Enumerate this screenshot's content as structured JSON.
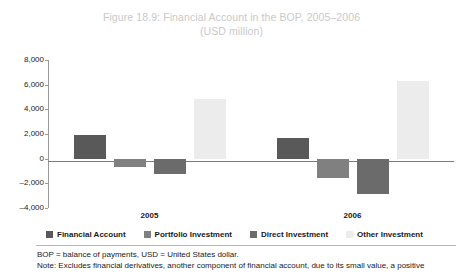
{
  "figure": {
    "title_line1": "Figure 18.9: Financial Account in the BOP, 2005–2006",
    "title_line2": "(USD million)",
    "title_color": "#c9c9c9"
  },
  "chart_data": {
    "type": "bar",
    "title": "Figure 18.9: Financial Account in the BOP, 2005–2006 (USD million)",
    "xlabel": "",
    "ylabel": "",
    "ylim": [
      -4000,
      8000
    ],
    "ytick_step": 2000,
    "grid": false,
    "legend_position": "bottom",
    "categories": [
      "2005",
      "2006"
    ],
    "tick_labels": [
      "8,000",
      "6,000",
      "4,000",
      "2,000",
      "0",
      "–2,000",
      "–4,000"
    ],
    "tick_values": [
      8000,
      6000,
      4000,
      2000,
      0,
      -2000,
      -4000
    ],
    "series": [
      {
        "name": "Financial Account",
        "color": "#595959",
        "values": [
          1900,
          1700
        ]
      },
      {
        "name": "Portfolio Investment",
        "color": "#808080",
        "values": [
          -700,
          -1600
        ]
      },
      {
        "name": "Direct Investment",
        "color": "#6b6b6b",
        "values": [
          -1250,
          -2900
        ]
      },
      {
        "name": "Other Investment",
        "color": "#ececec",
        "values": [
          4800,
          6300
        ]
      }
    ]
  },
  "notes": {
    "line1": "BOP = balance of payments, USD = United States dollar.",
    "line2": "Note: Excludes financial derivatives, another component of financial account, due to its small value, a positive"
  }
}
